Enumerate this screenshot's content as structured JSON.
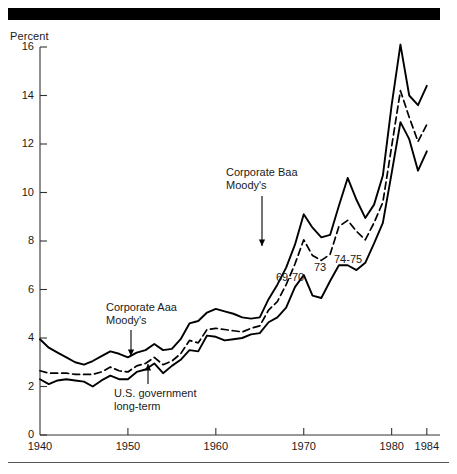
{
  "figure": {
    "top_rule_color": "#000000",
    "bottom_rule_color": "#555555",
    "background": "#ffffff"
  },
  "chart_data": {
    "type": "line",
    "title": "",
    "subtitle": "",
    "xlabel": "",
    "ylabel": "Percent",
    "xlim": [
      1940,
      1985.5
    ],
    "ylim": [
      0,
      16.6
    ],
    "grid": false,
    "legend_position": "none (inline annotations with leader lines)",
    "yticks": [
      0,
      2,
      4,
      6,
      8,
      10,
      12,
      14,
      16
    ],
    "ytick_labels": [
      "0",
      "2",
      "4",
      "6",
      "8",
      "10",
      "12",
      "14",
      "16"
    ],
    "xticks": [
      1940,
      1950,
      1960,
      1970,
      1980,
      1984
    ],
    "xtick_labels": [
      "1940",
      "1950",
      "1960",
      "1970",
      "1980",
      "1984"
    ],
    "x": [
      1940,
      1941,
      1942,
      1943,
      1944,
      1945,
      1946,
      1947,
      1948,
      1949,
      1950,
      1951,
      1952,
      1953,
      1954,
      1955,
      1956,
      1957,
      1958,
      1959,
      1960,
      1961,
      1962,
      1963,
      1964,
      1965,
      1966,
      1967,
      1968,
      1969,
      1970,
      1971,
      1972,
      1973,
      1974,
      1975,
      1976,
      1977,
      1978,
      1979,
      1980,
      1981,
      1982,
      1983,
      1984
    ],
    "series": [
      {
        "name": "Corporate Baa Moody's",
        "style": "solid",
        "color": "#000000",
        "values": [
          3.95,
          3.6,
          3.4,
          3.2,
          3.0,
          2.9,
          3.05,
          3.25,
          3.45,
          3.35,
          3.2,
          3.4,
          3.5,
          3.75,
          3.5,
          3.55,
          3.95,
          4.6,
          4.7,
          5.05,
          5.2,
          5.1,
          5.0,
          4.85,
          4.8,
          4.85,
          5.6,
          6.2,
          6.9,
          7.85,
          9.1,
          8.55,
          8.15,
          8.25,
          9.45,
          10.6,
          9.7,
          8.95,
          9.5,
          10.7,
          13.6,
          16.1,
          14.0,
          13.6,
          14.4
        ],
        "peak": {
          "year": 1981,
          "value": 16.1
        }
      },
      {
        "name": "Corporate Aaa Moody's",
        "style": "dashed",
        "color": "#000000",
        "values": [
          2.65,
          2.55,
          2.55,
          2.55,
          2.5,
          2.5,
          2.5,
          2.6,
          2.8,
          2.65,
          2.6,
          2.85,
          2.95,
          3.2,
          2.9,
          3.05,
          3.35,
          3.9,
          3.8,
          4.35,
          4.4,
          4.35,
          4.3,
          4.25,
          4.4,
          4.5,
          5.15,
          5.5,
          6.2,
          7.05,
          8.05,
          7.4,
          7.2,
          7.45,
          8.6,
          8.85,
          8.4,
          8.05,
          8.75,
          9.6,
          11.9,
          14.2,
          13.1,
          12.1,
          12.8
        ],
        "peak": {
          "year": 1981,
          "value": 14.2
        }
      },
      {
        "name": "U.S. government long-term",
        "style": "solid",
        "color": "#000000",
        "values": [
          2.3,
          2.1,
          2.25,
          2.3,
          2.25,
          2.2,
          2.0,
          2.25,
          2.45,
          2.3,
          2.3,
          2.6,
          2.7,
          2.95,
          2.55,
          2.85,
          3.1,
          3.5,
          3.45,
          4.1,
          4.05,
          3.9,
          3.95,
          4.0,
          4.15,
          4.2,
          4.65,
          4.85,
          5.25,
          6.1,
          6.6,
          5.75,
          5.65,
          6.35,
          7.0,
          7.0,
          6.8,
          7.1,
          7.9,
          8.75,
          10.8,
          12.9,
          12.2,
          10.9,
          11.7
        ],
        "peak": {
          "year": 1981,
          "value": 12.9
        }
      }
    ],
    "annotations": [
      {
        "id": "corporate-aaa",
        "text_lines": [
          "Corporate Aaa",
          "Moody's"
        ],
        "target_series": "Corporate Aaa Moody's",
        "leader": "vertical line with downward arrow"
      },
      {
        "id": "us-government",
        "text_lines": [
          "U.S. government",
          "long-term"
        ],
        "target_series": "U.S. government long-term",
        "leader": "vertical line with upward arrow"
      },
      {
        "id": "corporate-baa",
        "text_lines": [
          "Corporate Baa",
          "Moody's"
        ],
        "target_series": "Corporate Baa Moody's",
        "leader": "vertical line with downward arrow"
      },
      {
        "id": "recession-69-70",
        "text_lines": [
          "69-70"
        ],
        "leader": "none"
      },
      {
        "id": "recession-73",
        "text_lines": [
          "73"
        ],
        "leader": "none"
      },
      {
        "id": "recession-74-75",
        "text_lines": [
          "74-75"
        ],
        "leader": "none"
      }
    ]
  }
}
